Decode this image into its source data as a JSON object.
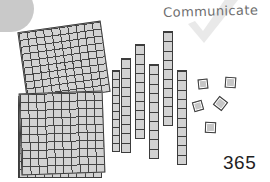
{
  "heading": {
    "text": "Communicate",
    "color": "#6e6e6e"
  },
  "watermark": {
    "icon": "check-mark-icon",
    "color": "#d6d6d6"
  },
  "corner_decoration": {
    "shape": "rounded-blob",
    "color": "#c9c9c9"
  },
  "answer": {
    "value": "365"
  },
  "chart_data": {
    "type": "table",
    "title": "Communicate",
    "subtitle": "Base-ten blocks representing 365",
    "block_colors": {
      "fill": "#d2d2d2",
      "stroke": "#3c3c3c"
    },
    "categories": [
      "hundreds",
      "tens",
      "ones"
    ],
    "values": [
      3,
      6,
      5
    ],
    "total": 365,
    "xlabel": "place value",
    "ylabel": "count",
    "legend": [
      "flat = 100",
      "rod = 10",
      "unit = 1"
    ],
    "annotations": [
      "365"
    ],
    "groups": [
      {
        "name": "hundreds-flats",
        "label": "hundreds",
        "unit_value": 100,
        "count": 3,
        "subtotal": 300,
        "items": [
          {
            "id": "flat-1",
            "x": 18,
            "y": 96,
            "w": 84,
            "h": 82,
            "rotation": 0
          },
          {
            "id": "flat-2",
            "x": 22,
            "y": 26,
            "w": 84,
            "h": 72,
            "rotation": -8
          },
          {
            "id": "flat-3",
            "x": 20,
            "y": 92,
            "w": 84,
            "h": 82,
            "rotation": -2
          }
        ]
      },
      {
        "name": "tens-rods",
        "label": "tens",
        "unit_value": 10,
        "count": 6,
        "subtotal": 60,
        "items": [
          {
            "id": "rod-1",
            "x": 121,
            "y": 58,
            "w": 10,
            "h": 95
          },
          {
            "id": "rod-2",
            "x": 135,
            "y": 44,
            "w": 10,
            "h": 95
          },
          {
            "id": "rod-3",
            "x": 149,
            "y": 64,
            "w": 10,
            "h": 95
          },
          {
            "id": "rod-4",
            "x": 163,
            "y": 31,
            "w": 10,
            "h": 95
          },
          {
            "id": "rod-5",
            "x": 177,
            "y": 70,
            "w": 10,
            "h": 95
          },
          {
            "id": "rod-6",
            "x": 112,
            "y": 70,
            "w": 8,
            "h": 82
          }
        ]
      },
      {
        "name": "ones-units",
        "label": "ones",
        "unit_value": 1,
        "count": 5,
        "subtotal": 5,
        "items": [
          {
            "id": "unit-1",
            "x": 198,
            "y": 79,
            "w": 10,
            "h": 10,
            "rotation": -6
          },
          {
            "id": "unit-2",
            "x": 225,
            "y": 77,
            "w": 11,
            "h": 11,
            "rotation": 4
          },
          {
            "id": "unit-3",
            "x": 193,
            "y": 101,
            "w": 10,
            "h": 10,
            "rotation": -16
          },
          {
            "id": "unit-4",
            "x": 215,
            "y": 98,
            "w": 11,
            "h": 11,
            "rotation": 38
          },
          {
            "id": "unit-5",
            "x": 205,
            "y": 122,
            "w": 11,
            "h": 11,
            "rotation": 2
          }
        ]
      }
    ]
  }
}
